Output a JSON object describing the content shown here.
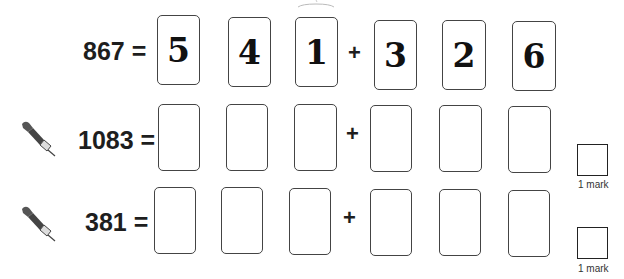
{
  "worksheet": {
    "rows": [
      {
        "label": "867 =",
        "has_pen_icon": false,
        "cards_left": [
          "5",
          "4",
          "1"
        ],
        "operator": "+",
        "cards_right": [
          "3",
          "2",
          "6"
        ],
        "mark_label": ""
      },
      {
        "label": "1083 =",
        "has_pen_icon": true,
        "cards_left": [
          "",
          "",
          ""
        ],
        "operator": "+",
        "cards_right": [
          "",
          "",
          ""
        ],
        "mark_label": "1 mark"
      },
      {
        "label": "381 =",
        "has_pen_icon": true,
        "cards_left": [
          "",
          "",
          ""
        ],
        "operator": "+",
        "cards_right": [
          "",
          "",
          ""
        ],
        "mark_label": "1 mark"
      }
    ],
    "icons": {
      "pen": "pen-nib-icon"
    },
    "colors": {
      "text": "#1e1e1e",
      "card_border": "#444444",
      "background": "#ffffff"
    }
  }
}
